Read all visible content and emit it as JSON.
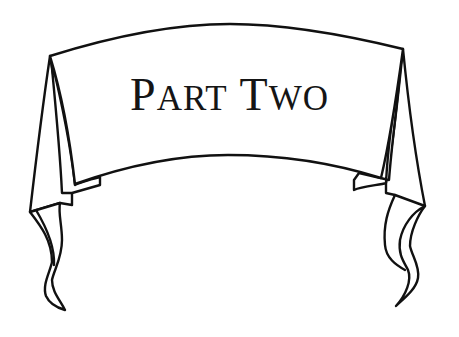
{
  "banner": {
    "title": "Part Two",
    "words": [
      {
        "cap": "P",
        "rest": "ART"
      },
      {
        "cap": "T",
        "rest": "WO"
      }
    ]
  },
  "colors": {
    "ink": "#111111",
    "background": "#ffffff"
  }
}
